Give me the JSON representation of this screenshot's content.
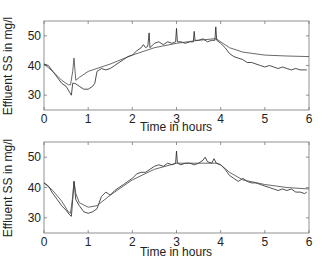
{
  "chart_data": [
    {
      "type": "line",
      "title": "",
      "xlabel": "Time in hours",
      "ylabel": "Effluent SS in mg/l",
      "xlim": [
        0,
        6
      ],
      "ylim": [
        25,
        55
      ],
      "xticks": [
        0,
        1,
        2,
        3,
        4,
        5,
        6
      ],
      "yticks": [
        30,
        40,
        50
      ],
      "grid": false,
      "legend": null,
      "series": [
        {
          "name": "measured",
          "x": [
            0,
            0.1,
            0.2,
            0.3,
            0.4,
            0.5,
            0.58,
            0.62,
            0.65,
            0.7,
            0.8,
            0.9,
            1.0,
            1.1,
            1.15,
            1.2,
            1.3,
            1.4,
            1.5,
            1.6,
            1.7,
            1.8,
            1.9,
            2.0,
            2.1,
            2.2,
            2.25,
            2.3,
            2.35,
            2.38,
            2.4,
            2.5,
            2.6,
            2.7,
            2.8,
            2.9,
            2.98,
            3.0,
            3.02,
            3.1,
            3.2,
            3.3,
            3.38,
            3.4,
            3.42,
            3.5,
            3.6,
            3.7,
            3.8,
            3.87,
            3.89,
            3.91,
            4.0,
            4.1,
            4.2,
            4.3,
            4.4,
            4.5,
            4.6,
            4.7,
            4.8,
            4.9,
            5.0,
            5.1,
            5.2,
            5.3,
            5.4,
            5.5,
            5.6,
            5.7,
            5.8,
            5.9,
            5.95
          ],
          "y": [
            40.5,
            40,
            38,
            36,
            34,
            33,
            31,
            30,
            34,
            34,
            33,
            32,
            32,
            33,
            34,
            38,
            39,
            38.5,
            39,
            40,
            41,
            42,
            43,
            43.5,
            45,
            46,
            47,
            46,
            46.5,
            51,
            46,
            47.5,
            48,
            47,
            48,
            47.5,
            48,
            52.5,
            48,
            48,
            47.5,
            48,
            48,
            51.5,
            48.5,
            48.5,
            49,
            48,
            48.5,
            48.5,
            53,
            48.5,
            47.5,
            46,
            44,
            43,
            42.5,
            42,
            41,
            41,
            40.5,
            40,
            39.5,
            40,
            39.5,
            39,
            39.5,
            39,
            38.5,
            39,
            38.5,
            38.5,
            38.5
          ]
        },
        {
          "name": "model",
          "x": [
            0,
            0.2,
            0.4,
            0.55,
            0.6,
            0.65,
            0.68,
            0.72,
            0.8,
            1.0,
            1.5,
            2.0,
            2.5,
            3.0,
            3.5,
            3.85,
            3.9,
            4.0,
            4.2,
            4.5,
            5.0,
            5.5,
            6.0
          ],
          "y": [
            40.5,
            38,
            35,
            33.5,
            33.5,
            38,
            42.5,
            35,
            36,
            38,
            40.5,
            43.5,
            46,
            47.5,
            48.5,
            49,
            49,
            48,
            46,
            44.5,
            43.5,
            43.2,
            43
          ]
        }
      ]
    },
    {
      "type": "line",
      "title": "",
      "xlabel": "Time in hours",
      "ylabel": "Effluent SS in mg/l",
      "xlim": [
        0,
        6
      ],
      "ylim": [
        25,
        55
      ],
      "xticks": [
        0,
        1,
        2,
        3,
        4,
        5,
        6
      ],
      "yticks": [
        30,
        40,
        50
      ],
      "grid": false,
      "legend": null,
      "series": [
        {
          "name": "measured",
          "x": [
            0,
            0.1,
            0.2,
            0.3,
            0.4,
            0.5,
            0.58,
            0.62,
            0.65,
            0.68,
            0.72,
            0.8,
            0.9,
            1.0,
            1.1,
            1.2,
            1.3,
            1.4,
            1.5,
            1.6,
            1.7,
            1.8,
            1.9,
            2.0,
            2.1,
            2.2,
            2.3,
            2.4,
            2.5,
            2.6,
            2.7,
            2.8,
            2.9,
            2.98,
            3.0,
            3.02,
            3.1,
            3.2,
            3.3,
            3.4,
            3.5,
            3.6,
            3.65,
            3.7,
            3.8,
            3.85,
            3.9,
            4.0,
            4.1,
            4.2,
            4.3,
            4.4,
            4.5,
            4.6,
            4.7,
            4.8,
            4.9,
            5.0,
            5.1,
            5.2,
            5.3,
            5.4,
            5.5,
            5.6,
            5.7,
            5.8,
            5.9,
            5.95
          ],
          "y": [
            41.5,
            40.5,
            38,
            36,
            34,
            32.5,
            31,
            30.5,
            36,
            42,
            36,
            34,
            32,
            31.5,
            32,
            33,
            37,
            38.5,
            37.5,
            39,
            40,
            41,
            42,
            43,
            44.5,
            45,
            45,
            46,
            47,
            47.5,
            47,
            48,
            47.5,
            48,
            52,
            48,
            47.5,
            48,
            48,
            47.5,
            48,
            49,
            50,
            48.5,
            48,
            49.5,
            48,
            47.5,
            46,
            44,
            43,
            42,
            43,
            42,
            41.5,
            41.5,
            41,
            40.5,
            40,
            39.5,
            39,
            39.5,
            39,
            39.5,
            38.5,
            38.5,
            38,
            38.5
          ]
        },
        {
          "name": "model",
          "x": [
            0,
            0.2,
            0.4,
            0.55,
            0.6,
            0.65,
            0.68,
            0.72,
            0.8,
            1.0,
            1.2,
            1.5,
            2.0,
            2.5,
            3.0,
            3.5,
            3.9,
            4.0,
            4.2,
            4.5,
            5.0,
            5.5,
            6.0
          ],
          "y": [
            41.5,
            39,
            35.5,
            32,
            31.5,
            37,
            42,
            38,
            35,
            33.5,
            34,
            37.5,
            42.5,
            46,
            48,
            48,
            48,
            47.5,
            45,
            42.5,
            41,
            40,
            39.5
          ]
        }
      ]
    }
  ]
}
